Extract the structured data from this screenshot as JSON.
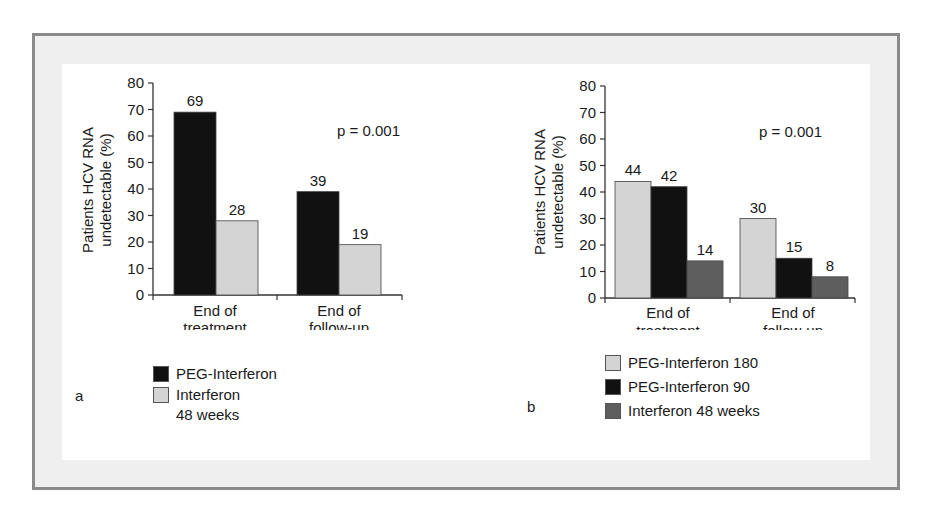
{
  "chart_data": [
    {
      "type": "bar",
      "panel": "a",
      "title": "",
      "xlabel": "",
      "ylabel": "Patients HCV RNA undetectable (%)",
      "ylim": [
        0,
        80
      ],
      "yticks": [
        0,
        10,
        20,
        30,
        40,
        50,
        60,
        70,
        80
      ],
      "categories": [
        "End of treatment",
        "End of follow-up"
      ],
      "series": [
        {
          "name": "PEG-Interferon",
          "color": "#111111",
          "values": [
            69,
            39
          ]
        },
        {
          "name": "Interferon 48 weeks",
          "color": "#d4d4d4",
          "values": [
            28,
            19
          ]
        }
      ],
      "annotations": [
        "p = 0.001"
      ],
      "grid": false,
      "legend_position": "bottom"
    },
    {
      "type": "bar",
      "panel": "b",
      "title": "",
      "xlabel": "",
      "ylabel": "Patients HCV RNA undetectable (%)",
      "ylim": [
        0,
        80
      ],
      "yticks": [
        0,
        10,
        20,
        30,
        40,
        50,
        60,
        70,
        80
      ],
      "categories": [
        "End of treatment",
        "End of follow-up"
      ],
      "series": [
        {
          "name": "PEG-Interferon 180",
          "color": "#d4d4d4",
          "values": [
            44,
            30
          ]
        },
        {
          "name": "PEG-Interferon 90",
          "color": "#111111",
          "values": [
            42,
            15
          ]
        },
        {
          "name": "Interferon 48 weeks",
          "color": "#5e5e5e",
          "values": [
            14,
            8
          ]
        }
      ],
      "annotations": [
        "p = 0.001"
      ],
      "grid": false,
      "legend_position": "bottom"
    }
  ],
  "labels": {
    "ylabel_line1": "Patients HCV RNA",
    "ylabel_line2": "undetectable (%)",
    "pvalue": "p = 0.001",
    "cat1_line1": "End of",
    "cat1_line2": "treatment",
    "cat2_line1": "End of",
    "cat2_line2": "follow-up"
  },
  "panel_a": {
    "label": "a",
    "legend": [
      {
        "text": "PEG-Interferon",
        "color": "#111111"
      },
      {
        "text": "Interferon",
        "text2": "48 weeks",
        "color": "#d4d4d4"
      }
    ]
  },
  "panel_b": {
    "label": "b",
    "legend": [
      {
        "text": "PEG-Interferon 180",
        "color": "#d4d4d4"
      },
      {
        "text": "PEG-Interferon 90",
        "color": "#111111"
      },
      {
        "text": "Interferon 48 weeks",
        "color": "#5e5e5e"
      }
    ]
  }
}
